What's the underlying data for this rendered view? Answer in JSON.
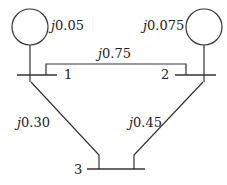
{
  "diagram": {
    "type": "power-system-one-line",
    "generators": [
      {
        "id": "gen1",
        "bus": "1",
        "reactance_j": "j",
        "reactance_val": "0.05"
      },
      {
        "id": "gen2",
        "bus": "2",
        "reactance_j": "j",
        "reactance_val": "0.075"
      }
    ],
    "buses": [
      {
        "id": "bus1",
        "label": "1"
      },
      {
        "id": "bus2",
        "label": "2"
      },
      {
        "id": "bus3",
        "label": "3"
      }
    ],
    "lines": [
      {
        "id": "line12",
        "from": "1",
        "to": "2",
        "reactance_j": "j",
        "reactance_val": "0.75"
      },
      {
        "id": "line13",
        "from": "1",
        "to": "3",
        "reactance_j": "j",
        "reactance_val": "0.30"
      },
      {
        "id": "line23",
        "from": "2",
        "to": "3",
        "reactance_j": "j",
        "reactance_val": "0.45"
      }
    ],
    "colors": {
      "stroke": "#333333",
      "text": "#222222",
      "background": "#ffffff"
    }
  }
}
